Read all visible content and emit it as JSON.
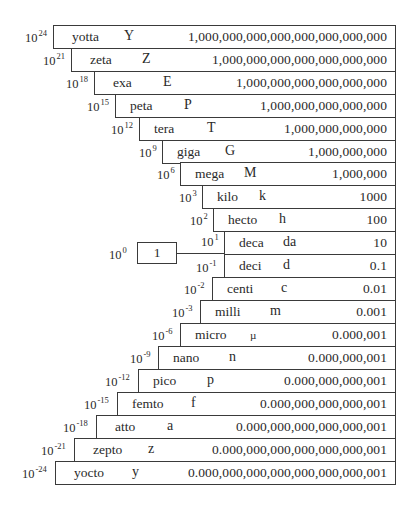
{
  "diagram": {
    "unity": {
      "exponent_base": "10",
      "exponent": "0",
      "value": "1"
    },
    "rows": [
      {
        "base": "10",
        "exp": "24",
        "name": "yotta",
        "symbol": "Y",
        "value": "1,000,000,000,000,000,000,000,000",
        "left": 53,
        "top": 25,
        "sym_x": 70
      },
      {
        "base": "10",
        "exp": "21",
        "name": "zeta",
        "symbol": "Z",
        "value": "1,000,000,000,000,000,000,000",
        "left": 71,
        "top": 48,
        "sym_x": 70
      },
      {
        "base": "10",
        "exp": "18",
        "name": "exa",
        "symbol": "E",
        "value": "1,000,000,000,000,000,000",
        "left": 94,
        "top": 71,
        "sym_x": 68
      },
      {
        "base": "10",
        "exp": "15",
        "name": "peta",
        "symbol": "P",
        "value": "1,000,000,000,000,000",
        "left": 115,
        "top": 94,
        "sym_x": 68
      },
      {
        "base": "10",
        "exp": "12",
        "name": "tera",
        "symbol": "T",
        "value": "1,000,000,000,000",
        "left": 139,
        "top": 117,
        "sym_x": 67
      },
      {
        "base": "10",
        "exp": "9",
        "name": "giga",
        "symbol": "G",
        "value": "1,000,000,000",
        "left": 162,
        "top": 140,
        "sym_x": 62
      },
      {
        "base": "10",
        "exp": "6",
        "name": "mega",
        "symbol": "M",
        "value": "1,000,000",
        "left": 180,
        "top": 162,
        "sym_x": 63
      },
      {
        "base": "10",
        "exp": "3",
        "name": "kilo",
        "symbol": "k",
        "value": "1000",
        "left": 202,
        "top": 185,
        "sym_x": 56
      },
      {
        "base": "10",
        "exp": "2",
        "name": "hecto",
        "symbol": "h",
        "value": "100",
        "left": 213,
        "top": 208,
        "sym_x": 65
      },
      {
        "base": "10",
        "exp": "1",
        "name": "deca",
        "symbol": "da",
        "value": "10",
        "left": 224,
        "top": 231,
        "sym_x": 58
      },
      {
        "base": "10",
        "exp": "-1",
        "name": "deci",
        "symbol": "d",
        "value": "0.1",
        "left": 224,
        "top": 254,
        "sym_x": 58
      },
      {
        "base": "10",
        "exp": "-2",
        "name": "centi",
        "symbol": "c",
        "value": "0.01",
        "left": 212,
        "top": 277,
        "sym_x": 68
      },
      {
        "base": "10",
        "exp": "-3",
        "name": "milli",
        "symbol": "m",
        "value": "0.001",
        "left": 200,
        "top": 300,
        "sym_x": 69
      },
      {
        "base": "10",
        "exp": "-6",
        "name": "micro",
        "symbol": "µ",
        "value": "0.000,001",
        "left": 180,
        "top": 323,
        "sym_x": 69
      },
      {
        "base": "10",
        "exp": "-9",
        "name": "nano",
        "symbol": "n",
        "value": "0.000,000,001",
        "left": 158,
        "top": 346,
        "sym_x": 70
      },
      {
        "base": "10",
        "exp": "-12",
        "name": "pico",
        "symbol": "p",
        "value": "0.000,000,000,001",
        "left": 138,
        "top": 369,
        "sym_x": 68
      },
      {
        "base": "10",
        "exp": "-15",
        "name": "femto",
        "symbol": "f",
        "value": "0.000,000,000,000,001",
        "left": 117,
        "top": 392,
        "sym_x": 73
      },
      {
        "base": "10",
        "exp": "-18",
        "name": "atto",
        "symbol": "a",
        "value": "0.000,000,000,000,000,001",
        "left": 96,
        "top": 415,
        "sym_x": 70
      },
      {
        "base": "10",
        "exp": "-21",
        "name": "zepto",
        "symbol": "z",
        "value": "0.000,000,000,000,000,000,001",
        "left": 74,
        "top": 438,
        "sym_x": 73
      },
      {
        "base": "10",
        "exp": "-24",
        "name": "yocto",
        "symbol": "y",
        "value": "0.000,000,000,000,000,000,000,001",
        "left": 55,
        "top": 461,
        "sym_x": 76
      }
    ]
  }
}
